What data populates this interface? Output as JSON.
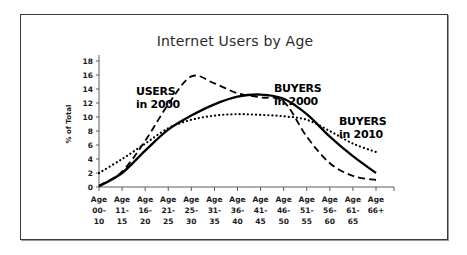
{
  "figure": {
    "title": "Internet Users by Age",
    "border_color": "#3a3a3a",
    "background": "#ffffff"
  },
  "chart_data": {
    "type": "line",
    "title": "Internet Users by Age",
    "xlabel": "",
    "ylabel": "% of Total",
    "ylim": [
      0,
      18
    ],
    "yticks": [
      0,
      2,
      4,
      6,
      8,
      10,
      12,
      14,
      16,
      18
    ],
    "grid": false,
    "legend_position": "inline-annotations",
    "categories": [
      "Age 00-10",
      "Age 11-15",
      "Age 16-20",
      "Age 21-25",
      "Age 25-30",
      "Age 31-35",
      "Age 36-40",
      "Age 41-45",
      "Age 46-50",
      "Age 51-55",
      "Age 56-60",
      "Age 61-65",
      "Age 66+"
    ],
    "category_lines": [
      [
        "Age",
        "00-",
        "10"
      ],
      [
        "Age",
        "11-",
        "15"
      ],
      [
        "Age",
        "16-",
        "20"
      ],
      [
        "Age",
        "21-",
        "25"
      ],
      [
        "Age",
        "25-",
        "30"
      ],
      [
        "Age",
        "31-",
        "35"
      ],
      [
        "Age",
        "36-",
        "40"
      ],
      [
        "Age",
        "41-",
        "45"
      ],
      [
        "Age",
        "46-",
        "50"
      ],
      [
        "Age",
        "51-",
        "55"
      ],
      [
        "Age",
        "56-",
        "60"
      ],
      [
        "Age",
        "61-",
        "65"
      ],
      [
        "Age",
        "66+",
        ""
      ]
    ],
    "series": [
      {
        "name": "USERS in 2000",
        "style": "dashed",
        "color": "#000000",
        "values": [
          0.2,
          2.2,
          6.6,
          11.8,
          15.8,
          14.8,
          13.4,
          12.8,
          12.2,
          7.2,
          3.4,
          1.6,
          1.0
        ]
      },
      {
        "name": "BUYERS in 2000",
        "style": "solid",
        "color": "#000000",
        "values": [
          0.1,
          2.0,
          5.2,
          8.2,
          10.2,
          11.8,
          12.9,
          13.2,
          12.6,
          10.4,
          7.2,
          4.4,
          2.0
        ]
      },
      {
        "name": "BUYERS in 2010",
        "style": "dotted",
        "color": "#000000",
        "values": [
          2.0,
          4.0,
          6.2,
          8.4,
          9.6,
          10.2,
          10.4,
          10.3,
          10.1,
          9.6,
          8.0,
          6.2,
          5.0
        ]
      }
    ],
    "annotations": [
      {
        "id": "users-2000",
        "line1": "USERS",
        "line2": "in 2000",
        "x": 115,
        "y": 80
      },
      {
        "id": "buyers-2000",
        "line1": "BUYERS",
        "line2": "in 2000",
        "x": 253,
        "y": 77
      },
      {
        "id": "buyers-2010",
        "line1": "BUYERS",
        "line2": "in 2010",
        "x": 318,
        "y": 110
      }
    ]
  }
}
